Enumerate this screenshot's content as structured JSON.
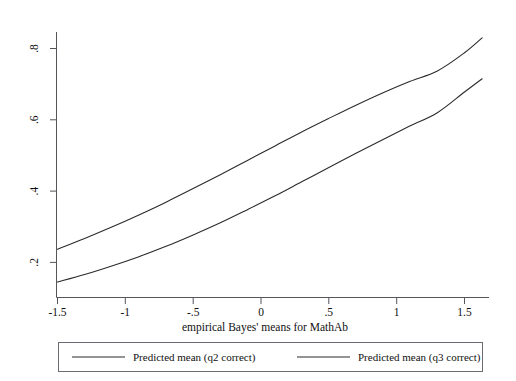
{
  "chart_data": {
    "type": "line",
    "title": "",
    "subtitle": "",
    "xlabel": "empirical Bayes' means for MathAb",
    "ylabel": "",
    "xlim": [
      -1.72,
      1.72
    ],
    "ylim": [
      0.118,
      0.855
    ],
    "grid": false,
    "legend_position": "bottom",
    "xticks": [
      -1.5,
      -1,
      -0.5,
      0,
      0.5,
      1,
      1.5
    ],
    "xticklabels": [
      "-1.5",
      "-1",
      "-.5",
      "0",
      ".5",
      "1",
      "1.5"
    ],
    "yticks": [
      0.2,
      0.4,
      0.6,
      0.8
    ],
    "yticklabels": [
      ".2",
      ".4",
      ".6",
      ".8"
    ],
    "x": [
      -1.5,
      -1.3,
      -1.1,
      -0.9,
      -0.7,
      -0.5,
      -0.3,
      -0.1,
      0.1,
      0.3,
      0.5,
      0.7,
      0.9,
      1.1,
      1.3,
      1.5,
      1.63
    ],
    "series": [
      {
        "name": "Predicted mean (q2 correct)",
        "color": "#2b2b2b",
        "values": [
          0.237,
          0.267,
          0.299,
          0.333,
          0.369,
          0.407,
          0.446,
          0.486,
          0.526,
          0.566,
          0.604,
          0.641,
          0.676,
          0.708,
          0.737,
          0.788,
          0.83
        ]
      },
      {
        "name": "Predicted mean (q3 correct)",
        "color": "#2b2b2b",
        "values": [
          0.145,
          0.166,
          0.19,
          0.216,
          0.245,
          0.277,
          0.311,
          0.348,
          0.386,
          0.426,
          0.466,
          0.506,
          0.545,
          0.583,
          0.62,
          0.678,
          0.715
        ]
      }
    ]
  },
  "legend": {
    "entries": [
      {
        "label": "Predicted mean (q2 correct)"
      },
      {
        "label": "Predicted mean (q3 correct)"
      }
    ]
  },
  "axes": {
    "x_title": "empirical Bayes' means for MathAb"
  }
}
